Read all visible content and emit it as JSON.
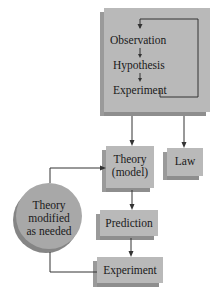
{
  "diagram": {
    "method_box": {
      "steps": [
        "Observation",
        "Hypothesis",
        "Experiment"
      ]
    },
    "theory_box": {
      "line1": "Theory",
      "line2": "(model)"
    },
    "law_box": {
      "label": "Law"
    },
    "prediction_box": {
      "label": "Prediction"
    },
    "experiment_box": {
      "label": "Experiment"
    },
    "modified_circle": {
      "line1": "Theory",
      "line2": "modified",
      "line3": "as needed"
    },
    "colors": {
      "box_fill": "#b9b9b9",
      "box_shadow": "#8e8e8e",
      "circle_fill": "#a8a8a8",
      "line": "#333333"
    }
  }
}
